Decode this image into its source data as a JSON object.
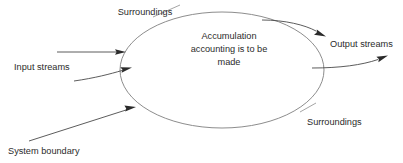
{
  "diagram": {
    "type": "system-boundary-accumulation-diagram",
    "system": {
      "shape": "ellipse",
      "label_lines": [
        "Accumulation",
        "accounting is to be",
        "made"
      ],
      "label_full": "Accumulation accounting is to be made",
      "center": {
        "x": 222,
        "y": 70
      },
      "rx": 102,
      "ry": 58,
      "stroke_color": "#8d8d8d"
    },
    "labels": {
      "surroundings_top": "Surroundings",
      "surroundings_bottom": "Surroundings",
      "input_streams": "Input streams",
      "output_streams": "Output streams",
      "system_boundary": "System boundary"
    },
    "colors": {
      "background": "#ffffff",
      "text": "#2b2b2b",
      "boundary_stroke": "#8d8d8d",
      "arrow_stroke": "#4a4a4a",
      "leader_stroke": "#8d8d8d"
    },
    "flows": [
      {
        "name": "input-stream-upper",
        "direction": "into-system",
        "style": "straight"
      },
      {
        "name": "input-stream-lower",
        "direction": "into-system",
        "style": "curved"
      },
      {
        "name": "output-stream-upper",
        "direction": "out-of-system",
        "style": "curved"
      },
      {
        "name": "output-stream-lower",
        "direction": "out-of-system",
        "style": "curved"
      }
    ],
    "leaders": [
      {
        "name": "surroundings-top-leader"
      },
      {
        "name": "surroundings-bottom-leader"
      },
      {
        "name": "system-boundary-pointer",
        "has_arrowhead": true
      }
    ]
  }
}
